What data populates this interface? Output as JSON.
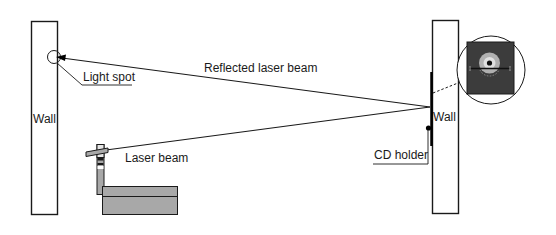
{
  "diagram": {
    "labels": {
      "left_wall": "Wall",
      "right_wall": "Wall",
      "light_spot": "Light spot",
      "reflected_beam": "Reflected laser beam",
      "laser_beam": "Laser beam",
      "cd_holder": "CD holder"
    },
    "colors": {
      "stroke": "#1a1a1a",
      "background": "#ffffff",
      "box_fill": "#a8a8a8",
      "inset_fill": "#3c3c3c",
      "cd_outer": "#b0b0b0",
      "cd_inner": "#e0e0e0"
    }
  }
}
